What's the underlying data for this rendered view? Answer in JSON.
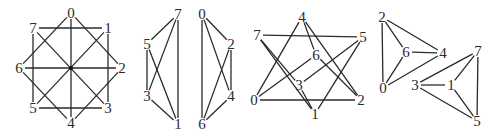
{
  "diagram": {
    "colors": {
      "line": "#2a2a2a",
      "background": "#ffffff"
    },
    "graphs": [
      {
        "id": "octagon-graph",
        "nodes": [
          {
            "label": "0",
            "x": 71,
            "y": 13
          },
          {
            "label": "1",
            "x": 108,
            "y": 28
          },
          {
            "label": "2",
            "x": 122,
            "y": 68
          },
          {
            "label": "3",
            "x": 108,
            "y": 108
          },
          {
            "label": "4",
            "x": 71,
            "y": 123
          },
          {
            "label": "5",
            "x": 33,
            "y": 108
          },
          {
            "label": "6",
            "x": 19,
            "y": 68
          },
          {
            "label": "7",
            "x": 33,
            "y": 28
          }
        ],
        "edges": [
          [
            "0",
            "4"
          ],
          [
            "6",
            "2"
          ],
          [
            "7",
            "1"
          ],
          [
            "5",
            "3"
          ],
          [
            "7",
            "5"
          ],
          [
            "1",
            "3"
          ],
          [
            "0",
            "6"
          ],
          [
            "0",
            "2"
          ],
          [
            "4",
            "6"
          ],
          [
            "4",
            "2"
          ],
          [
            "7",
            "3"
          ],
          [
            "5",
            "1"
          ]
        ],
        "center_dot": {
          "x": 71,
          "y": 68
        }
      },
      {
        "id": "k4-odd",
        "nodes": [
          {
            "label": "7",
            "x": 178,
            "y": 14
          },
          {
            "label": "5",
            "x": 147,
            "y": 44
          },
          {
            "label": "3",
            "x": 147,
            "y": 96
          },
          {
            "label": "1",
            "x": 178,
            "y": 124
          }
        ],
        "edges": [
          [
            "7",
            "5"
          ],
          [
            "7",
            "3"
          ],
          [
            "7",
            "1"
          ],
          [
            "5",
            "3"
          ],
          [
            "5",
            "1"
          ],
          [
            "3",
            "1"
          ]
        ]
      },
      {
        "id": "k4-even",
        "nodes": [
          {
            "label": "0",
            "x": 202,
            "y": 14
          },
          {
            "label": "2",
            "x": 231,
            "y": 44
          },
          {
            "label": "4",
            "x": 231,
            "y": 96
          },
          {
            "label": "6",
            "x": 202,
            "y": 124
          }
        ],
        "edges": [
          [
            "0",
            "2"
          ],
          [
            "0",
            "4"
          ],
          [
            "0",
            "6"
          ],
          [
            "2",
            "4"
          ],
          [
            "2",
            "6"
          ],
          [
            "4",
            "6"
          ]
        ]
      },
      {
        "id": "crossed-graph",
        "nodes": [
          {
            "label": "4",
            "x": 302,
            "y": 17
          },
          {
            "label": "7",
            "x": 257,
            "y": 35
          },
          {
            "label": "5",
            "x": 363,
            "y": 37
          },
          {
            "label": "6",
            "x": 316,
            "y": 55
          },
          {
            "label": "3",
            "x": 299,
            "y": 85
          },
          {
            "label": "0",
            "x": 254,
            "y": 100
          },
          {
            "label": "2",
            "x": 361,
            "y": 100
          },
          {
            "label": "1",
            "x": 315,
            "y": 114
          }
        ],
        "edges": [
          [
            "7",
            "5"
          ],
          [
            "0",
            "2"
          ],
          [
            "4",
            "0"
          ],
          [
            "4",
            "6"
          ],
          [
            "4",
            "2"
          ],
          [
            "6",
            "0"
          ],
          [
            "6",
            "2"
          ],
          [
            "7",
            "3"
          ],
          [
            "7",
            "1"
          ],
          [
            "5",
            "3"
          ],
          [
            "5",
            "1"
          ],
          [
            "3",
            "1"
          ]
        ]
      },
      {
        "id": "two-triangles-graph",
        "nodes": [
          {
            "label": "2",
            "x": 382,
            "y": 17
          },
          {
            "label": "6",
            "x": 406,
            "y": 52
          },
          {
            "label": "4",
            "x": 443,
            "y": 53
          },
          {
            "label": "0",
            "x": 383,
            "y": 88
          },
          {
            "label": "7",
            "x": 478,
            "y": 51
          },
          {
            "label": "3",
            "x": 415,
            "y": 85
          },
          {
            "label": "1",
            "x": 451,
            "y": 85
          },
          {
            "label": "5",
            "x": 477,
            "y": 121
          }
        ],
        "edges": [
          [
            "2",
            "0"
          ],
          [
            "2",
            "6"
          ],
          [
            "2",
            "4"
          ],
          [
            "6",
            "4"
          ],
          [
            "6",
            "0"
          ],
          [
            "0",
            "4"
          ],
          [
            "7",
            "5"
          ],
          [
            "7",
            "1"
          ],
          [
            "7",
            "3"
          ],
          [
            "3",
            "1"
          ],
          [
            "3",
            "5"
          ],
          [
            "1",
            "5"
          ]
        ]
      }
    ]
  }
}
